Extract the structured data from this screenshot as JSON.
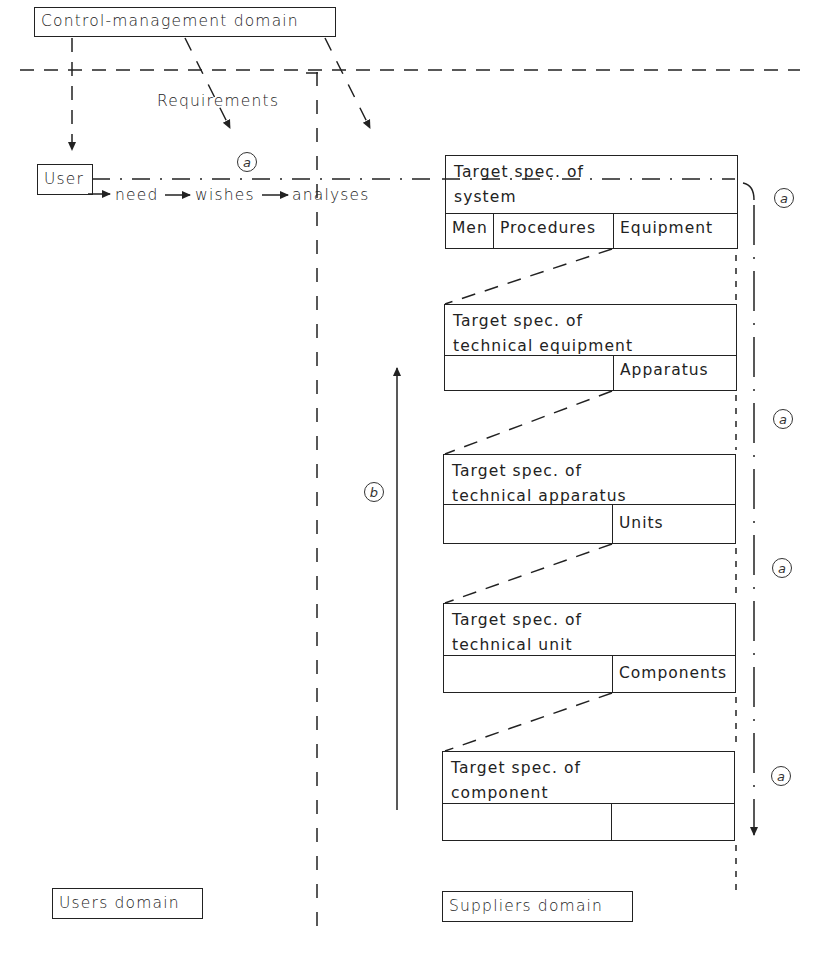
{
  "domains": {
    "control": "Control-management domain",
    "users": "Users domain",
    "suppliers": "Suppliers domain"
  },
  "user_box": "User",
  "flow": {
    "need": "need",
    "wishes": "wishes",
    "analyses": "analyses",
    "requirements": "Requirements"
  },
  "markers": {
    "a": "a",
    "b": "b"
  },
  "specs": [
    {
      "title": "Target spec. of\nsystem",
      "cells": [
        "Men",
        "Procedures",
        "Equipment"
      ]
    },
    {
      "title": "Target spec. of\ntechnical equipment",
      "cells": [
        "",
        "Apparatus"
      ]
    },
    {
      "title": "Target spec. of\ntechnical apparatus",
      "cells": [
        "",
        "Units"
      ]
    },
    {
      "title": "Target spec. of\ntechnical unit",
      "cells": [
        "",
        "Components"
      ]
    },
    {
      "title": "Target spec. of\ncomponent",
      "cells": [
        "",
        ""
      ]
    }
  ]
}
